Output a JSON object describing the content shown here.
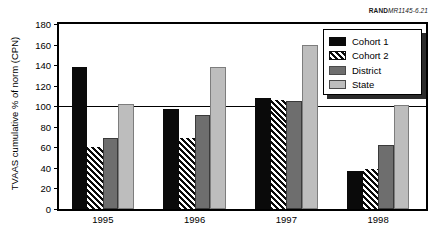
{
  "figure_id": {
    "prefix": "RAND",
    "number": "MR1145-6.21"
  },
  "chart_data": {
    "type": "bar",
    "title": "",
    "xlabel": "",
    "ylabel": "TVAAS cumulative % of norm (CPN)",
    "categories": [
      "1995",
      "1996",
      "1997",
      "1998"
    ],
    "series": [
      {
        "name": "Cohort 1",
        "color": "#0a0a0a",
        "values": [
          138,
          97,
          108,
          37
        ]
      },
      {
        "name": "Cohort 2",
        "color": "#0a0a0a",
        "pattern": "diagonal-hatch",
        "values": [
          60,
          69,
          106,
          39
        ]
      },
      {
        "name": "District",
        "color": "#6e6e6e",
        "values": [
          69,
          91,
          105,
          62
        ]
      },
      {
        "name": "State",
        "color": "#bdbdbd",
        "values": [
          102,
          138,
          160,
          101
        ]
      }
    ],
    "ylim": [
      0,
      180
    ],
    "yticks": [
      0,
      20,
      40,
      60,
      80,
      100,
      120,
      140,
      160,
      180
    ],
    "reference_line": 100,
    "grid": false,
    "legend_position": "upper-right"
  }
}
